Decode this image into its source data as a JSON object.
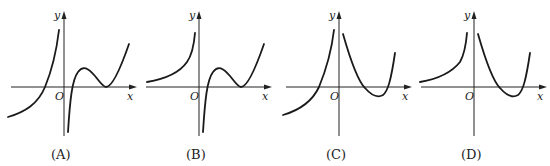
{
  "figure": {
    "axis_labels": {
      "x": "x",
      "y": "y",
      "origin": "O"
    },
    "panels": [
      {
        "id": "A",
        "caption": "(A)",
        "left_branch": "increasing from below x-axis, crosses x-axis left of origin, rises to +inf near y-axis",
        "right_branch": "from -inf near y-axis, rises to local max above axis, touches x-axis at local min, then rises"
      },
      {
        "id": "B",
        "caption": "(B)",
        "left_branch": "entirely above x-axis, increasing to +inf near y-axis",
        "right_branch": "from -inf near y-axis, rises to local max above axis, touches x-axis at local min, then rises"
      },
      {
        "id": "C",
        "caption": "(C)",
        "left_branch": "increasing from below x-axis, crosses x-axis left of origin, rises to +inf near y-axis",
        "right_branch": "from +inf near y-axis, decreases below x-axis to min, then rises crossing x-axis"
      },
      {
        "id": "D",
        "caption": "(D)",
        "left_branch": "entirely above x-axis, increasing to +inf near y-axis",
        "right_branch": "from +inf near y-axis, decreases below x-axis to min, then rises crossing x-axis"
      }
    ]
  }
}
